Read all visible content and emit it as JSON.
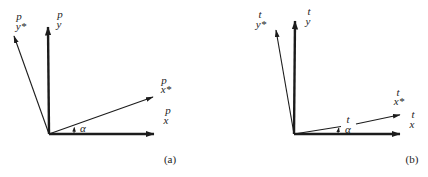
{
  "colors": {
    "ink": "#1c1c1c",
    "paper": "#ffffff"
  },
  "diagram_a": {
    "caption": "(a)",
    "labels": {
      "y_star": {
        "top": "p",
        "bottom": "y*"
      },
      "y": {
        "top": "p",
        "bottom": "y"
      },
      "x_star": {
        "top": "p",
        "bottom": "x*"
      },
      "x": {
        "top": "p",
        "bottom": "x"
      },
      "angle": "α"
    }
  },
  "diagram_b": {
    "caption": "(b)",
    "labels": {
      "y_star": {
        "top": "t",
        "bottom": "y*"
      },
      "y": {
        "top": "t",
        "bottom": "y"
      },
      "x_star": {
        "top": "t",
        "bottom": "x*"
      },
      "x": {
        "top": "t",
        "bottom": "x"
      },
      "angle": {
        "top": "t",
        "bottom": "α"
      }
    }
  }
}
